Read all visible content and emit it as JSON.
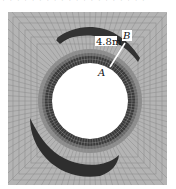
{
  "figure": {
    "type": "tunnel cross-section mesh contour",
    "labels": {
      "distance": "4.8m",
      "point_a": "A",
      "point_b": "B"
    },
    "colors": {
      "background": "#ffffff",
      "mesh_fill": "#b4b4b4",
      "mesh_line": "#8a8a8a",
      "ring_dark": "#3a3a3a",
      "ring_mid": "#6a6a6a",
      "crescent": "#2e2e2e",
      "hole": "#ffffff"
    }
  },
  "top_strip": {
    "text": "· · · · · · · · · · · · · · · · · · · ·"
  }
}
